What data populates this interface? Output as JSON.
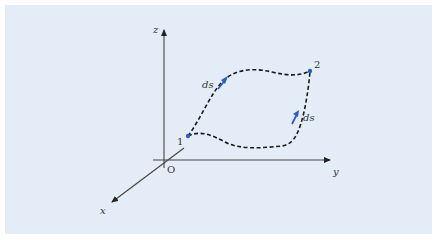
{
  "figure": {
    "background_color": "#e4edf7",
    "axes": {
      "x_label": "x",
      "y_label": "y",
      "z_label": "z",
      "origin_label": "O",
      "axis_color": "#333333"
    },
    "points": [
      {
        "label": "1",
        "color": "#2b5ec8"
      },
      {
        "label": "2",
        "color": "#2b5ec8"
      }
    ],
    "paths": [
      {
        "name": "upper-path",
        "style": "dashed",
        "color": "#1a1a1a",
        "element_label": "ds"
      },
      {
        "name": "lower-path",
        "style": "dashed",
        "color": "#1a1a1a",
        "element_label": "ds"
      }
    ],
    "arrow_color": "#2b5ec8"
  }
}
